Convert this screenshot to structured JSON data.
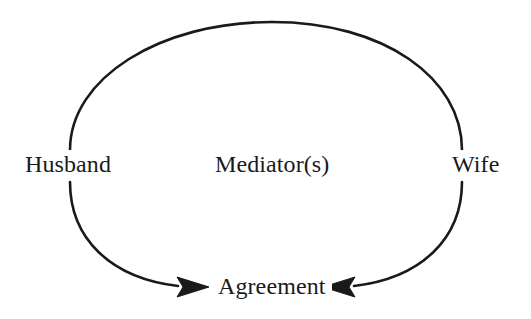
{
  "diagram": {
    "type": "cycle-with-convergent-arrows",
    "stroke_color": "#1a1a1a",
    "background_color": "#ffffff",
    "nodes": [
      {
        "id": "husband",
        "label": "Husband",
        "position": "left"
      },
      {
        "id": "mediators",
        "label": "Mediator(s)",
        "position": "center"
      },
      {
        "id": "wife",
        "label": "Wife",
        "position": "right"
      },
      {
        "id": "agreement",
        "label": "Agreement",
        "position": "bottom"
      }
    ],
    "arrows": [
      {
        "id": "husband-to-agreement",
        "from": "Husband",
        "to": "Agreement",
        "direction": "right"
      },
      {
        "id": "wife-to-agreement",
        "from": "Wife",
        "to": "Agreement",
        "direction": "left"
      }
    ]
  }
}
